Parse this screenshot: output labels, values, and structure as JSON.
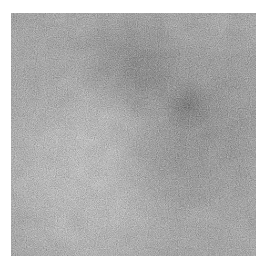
{
  "page": {
    "background": "#ffffff",
    "width": 269,
    "height": 269
  },
  "image": {
    "description": "Grainy grayscale photographic texture: diffuse dark smudge in the upper right with a small very dark core spot, and a bright near-white patch in the lower left, on a mid-gray noisy field with a white border",
    "area": {
      "left": 11,
      "top": 13,
      "width": 245,
      "height": 243
    },
    "base_color": "#c3c3c3",
    "blobs": [
      {
        "name": "dark-core-spot",
        "shape": "circle",
        "at": "72% 38%",
        "stops": [
          "rgba(22,22,22,0.62) 0%",
          "rgba(28,28,28,0.40) 4%",
          "rgba(40,40,40,0) 11%"
        ]
      },
      {
        "name": "dark-blob-upper",
        "shape": "circle",
        "at": "51% 21%",
        "stops": [
          "rgba(40,40,40,0.52) 0%",
          "rgba(50,50,50,0.32) 11%",
          "rgba(60,60,60,0) 26%"
        ]
      },
      {
        "name": "dark-region-right",
        "shape": "circle",
        "at": "79% 44%",
        "stops": [
          "rgba(60,60,60,0.42) 0%",
          "rgba(80,80,80,0.26) 18%",
          "rgba(100,100,100,0) 42%"
        ]
      },
      {
        "name": "dark-tail-lower",
        "shape": "circle",
        "at": "63% 64%",
        "stops": [
          "rgba(100,100,100,0.30) 0%",
          "rgba(110,110,110,0) 26%"
        ]
      },
      {
        "name": "bright-patch-core",
        "shape": "circle",
        "at": "30% 65%",
        "stops": [
          "rgba(255,255,255,1) 0%",
          "rgba(255,255,255,0.92) 13%",
          "rgba(255,255,255,0.55) 27%",
          "rgba(255,255,255,0) 46%"
        ]
      },
      {
        "name": "bright-streak-upper",
        "shape": "circle",
        "at": "41% 42%",
        "stops": [
          "rgba(250,250,250,0.50) 0%",
          "rgba(250,250,250,0) 22%"
        ]
      },
      {
        "name": "bright-patch-bottom",
        "shape": "circle",
        "at": "34% 84%",
        "stops": [
          "rgba(248,248,248,0.55) 0%",
          "rgba(248,248,248,0) 30%"
        ]
      }
    ],
    "noise": {
      "fine_frequency": 0.9,
      "fine_strength": 0.22,
      "mottle_frequency": 0.05,
      "mottle_strength": 0.1
    }
  }
}
